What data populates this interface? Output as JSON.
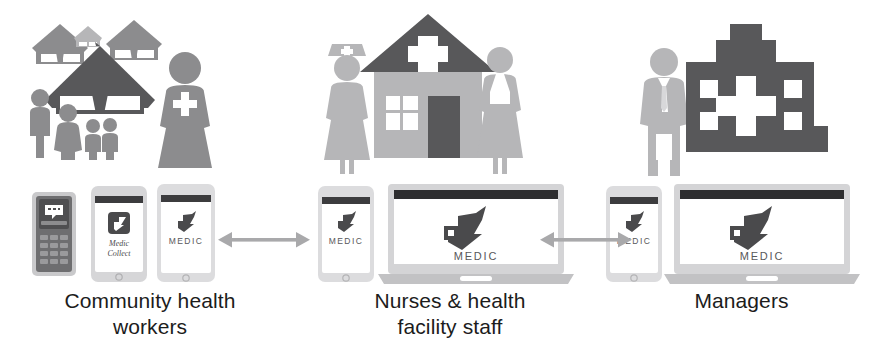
{
  "diagram": {
    "palette": {
      "dark_gray": "#58585a",
      "mid_gray": "#8c8c8e",
      "light_gray": "#b6b6b8",
      "pale_gray": "#d2d2d4",
      "arrow_gray": "#a9a9ab",
      "text_black": "#1c1c1c",
      "white": "#ffffff"
    },
    "columns": [
      {
        "id": "community-health-workers",
        "caption_lines": [
          "Community health",
          "workers"
        ],
        "scene": {
          "name": "village-scene",
          "elements": [
            "hut-back-left",
            "hut-back-small",
            "hut-back-right",
            "hut-main",
            "villager-man",
            "villager-woman",
            "villager-child-1",
            "villager-child-2",
            "community-health-worker"
          ]
        },
        "devices": [
          {
            "name": "feature-phone",
            "type": "feature-phone",
            "screen_icon": "sms-message-icon",
            "screen_label": ""
          },
          {
            "name": "smartphone-medic-collect",
            "type": "smartphone",
            "screen_icon": "medic-app-icon",
            "screen_label": "Medic Collect"
          },
          {
            "name": "smartphone-medic",
            "type": "smartphone",
            "screen_icon": "medic-bird-logo",
            "screen_label": "MEDIC"
          }
        ]
      },
      {
        "id": "nurses-health-facility-staff",
        "caption_lines": [
          "Nurses & health",
          "facility staff"
        ],
        "scene": {
          "name": "health-facility-scene",
          "elements": [
            "nurse-with-cap",
            "health-facility-building",
            "facility-staff-worker"
          ]
        },
        "devices": [
          {
            "name": "smartphone-medic",
            "type": "smartphone",
            "screen_icon": "medic-bird-logo",
            "screen_label": "MEDIC"
          },
          {
            "name": "laptop-medic",
            "type": "laptop",
            "screen_icon": "medic-bird-logo",
            "screen_label": "MEDIC"
          }
        ]
      },
      {
        "id": "managers",
        "caption_lines": [
          "Managers"
        ],
        "scene": {
          "name": "hospital-scene",
          "elements": [
            "manager-person",
            "hospital-building"
          ]
        },
        "devices": [
          {
            "name": "smartphone-medic",
            "type": "smartphone",
            "screen_icon": "medic-bird-logo",
            "screen_label": "MEDIC"
          },
          {
            "name": "laptop-medic",
            "type": "laptop",
            "screen_icon": "medic-bird-logo",
            "screen_label": "MEDIC"
          }
        ]
      }
    ],
    "connectors": [
      {
        "name": "connector-chw-to-nurses",
        "style": "double-headed-arrow"
      },
      {
        "name": "connector-nurses-to-managers",
        "style": "double-headed-arrow"
      }
    ]
  }
}
